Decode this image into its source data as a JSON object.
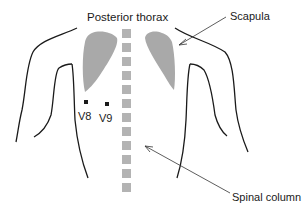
{
  "title": "Posterior thorax",
  "labels": {
    "scapula": "Scapula",
    "spinal_column": "Spinal column",
    "v8": "V8",
    "v9": "V9"
  },
  "colors": {
    "outline": "#1a1a1a",
    "scapula_fill": "#a9a9a9",
    "vertebra_fill": "#b3b3b3",
    "electrode": "#1a1a1a",
    "background": "#ffffff"
  },
  "vertebrae_count": 12
}
